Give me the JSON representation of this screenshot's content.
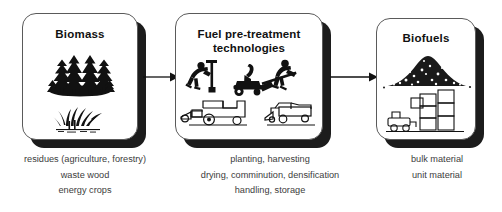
{
  "diagram": {
    "background_color": "#ffffff",
    "box_border_color": "#5a5a5a",
    "shadow_color": "#1c1c1c",
    "text_color": "#3c3c3c"
  },
  "stages": [
    {
      "id": "biomass",
      "title": "Biomass",
      "icons": [
        "conifer-trees-icon",
        "grass-plants-icon"
      ],
      "captions": [
        "residues (agriculture, forestry)",
        "waste wood",
        "energy crops"
      ]
    },
    {
      "id": "pretreatment",
      "title_line_1": "Fuel pre-treatment",
      "title_line_2": "technologies",
      "icons": [
        "worker-planting-icon",
        "wood-chipper-icon",
        "worker-shoveling-icon",
        "combine-harvester-icon",
        "baler-trailer-icon"
      ],
      "captions": [
        "planting, harvesting",
        "drying, comminution, densification",
        "handling, storage"
      ]
    },
    {
      "id": "biofuels",
      "title": "Biofuels",
      "icons": [
        "woodchip-pile-icon",
        "forklift-icon",
        "stacked-bales-icon"
      ],
      "captions": [
        "bulk material",
        "unit material"
      ]
    }
  ],
  "arrows": [
    {
      "id": "arrow-1",
      "from": "biomass",
      "to": "pretreatment",
      "icon": "right-arrow-icon"
    },
    {
      "id": "arrow-2",
      "from": "pretreatment",
      "to": "biofuels",
      "icon": "right-arrow-icon"
    }
  ]
}
